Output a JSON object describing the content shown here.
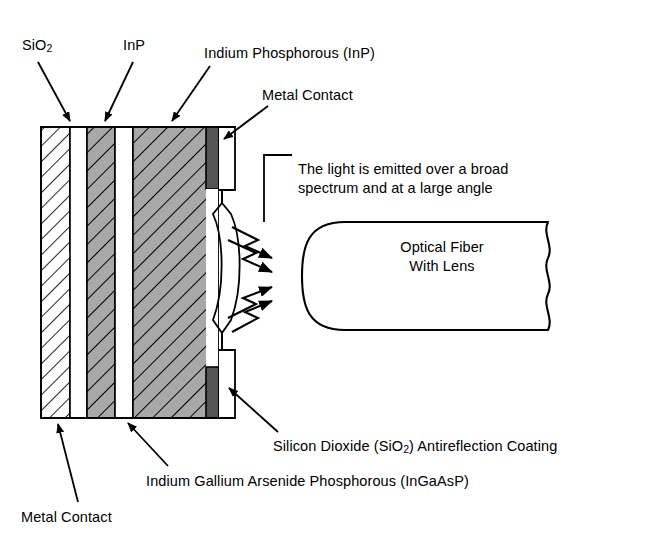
{
  "diagram": {
    "labels": {
      "sio2_short": "SiO",
      "sio2_short_sub": "2",
      "inp_short": "InP",
      "inp_full": "Indium Phosphorous (InP)",
      "metal_contact_top": "Metal Contact",
      "emission_note_line1": "The light is emitted over a broad",
      "emission_note_line2": "spectrum and at a large angle",
      "fiber_line1": "Optical Fiber",
      "fiber_line2": "With Lens",
      "sio2_ar_pre": "Silicon Dioxide (SiO",
      "sio2_ar_sub": "2",
      "sio2_ar_post": ") Antireflection Coating",
      "ingaasp_full": "Indium Gallium Arsenide Phosphorous (InGaAsP)",
      "metal_contact_bottom": "Metal Contact"
    },
    "colors": {
      "stroke": "#000000",
      "background": "#ffffff",
      "metal_contact_fill": "#545454",
      "inp_layer_fill": "#a8a8a8",
      "ingaasp_layer_fill": "#a8a8a8",
      "sio2_layer_fill": "#ffffff",
      "gap_fill": "#ffffff"
    },
    "structure": {
      "layers": [
        {
          "name": "sio2-left-layer",
          "material": "SiO2",
          "fill": "white",
          "hatch": true
        },
        {
          "name": "gap-1",
          "material": "",
          "fill": "white",
          "hatch": false
        },
        {
          "name": "inp-layer",
          "material": "InP",
          "fill": "gray",
          "hatch": true
        },
        {
          "name": "gap-2",
          "material": "",
          "fill": "white",
          "hatch": false
        },
        {
          "name": "ingaasp-layer",
          "material": "InGaAsP",
          "fill": "gray",
          "hatch": true
        },
        {
          "name": "metal-contact-column",
          "material": "Metal",
          "fill": "dark",
          "hatch": false
        }
      ],
      "emission_arrows": 4,
      "fiber": {
        "lens_end": "left-rounded",
        "break_line": "right-wavy"
      }
    }
  }
}
